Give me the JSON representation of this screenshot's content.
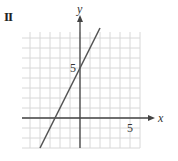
{
  "panel": {
    "label": "II"
  },
  "chart_data": {
    "type": "line",
    "title": "",
    "panel_label": "II",
    "xlabel": "x",
    "ylabel": "y",
    "x_tick_labels": [
      {
        "value": 5,
        "text": "5"
      }
    ],
    "y_tick_labels": [
      {
        "value": 5,
        "text": "5"
      }
    ],
    "xlim": [
      -6,
      6
    ],
    "ylim": [
      -3.5,
      9
    ],
    "grid": true,
    "grid_step": 1,
    "legend": null,
    "series": [
      {
        "name": "line",
        "note": "approximate endpoints estimated from the image; slope about 2, y-intercept near 5",
        "points": [
          [
            -4.0,
            -3.0
          ],
          [
            2.0,
            9.0
          ]
        ],
        "x_intercept_approx": -2.5,
        "y_intercept_approx": 5
      }
    ],
    "colors": {
      "grid": "#d8d8d8",
      "axes": "#444444",
      "line": "#555555"
    }
  }
}
